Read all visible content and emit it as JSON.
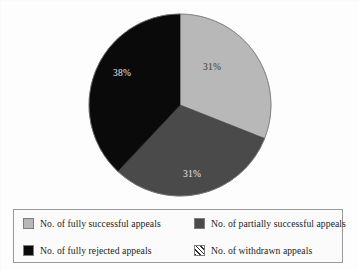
{
  "chart_data": {
    "type": "pie",
    "title": "",
    "subtitle": "",
    "xlabel": "",
    "ylabel": "",
    "grid": false,
    "legend_position": "bottom",
    "units": "percent",
    "start_angle_deg": 0,
    "direction": "clockwise",
    "categories": [
      "No. of fully successful appeals",
      "No. of partially successful appeals",
      "No. of fully rejected appeals",
      "No. of withdrawn appeals"
    ],
    "values": [
      31,
      31,
      38,
      0
    ],
    "data_labels": [
      "31%",
      "31%",
      "38%",
      ""
    ],
    "colors": [
      "#b8b8b8",
      "#4a4a4a",
      "#0a0a0a",
      "#ffffff"
    ],
    "slices": [
      {
        "label": "No. of fully successful appeals",
        "value": 31,
        "display": "31%",
        "color": "#b8b8b8",
        "pattern": "solid",
        "label_x": 212,
        "label_y": 70,
        "label_tone": "dark-text"
      },
      {
        "label": "No. of partially successful appeals",
        "value": 31,
        "display": "31%",
        "color": "#4a4a4a",
        "pattern": "solid",
        "label_x": 192,
        "label_y": 177,
        "label_tone": "light-text"
      },
      {
        "label": "No. of fully rejected appeals",
        "value": 38,
        "display": "38%",
        "color": "#0a0a0a",
        "pattern": "solid",
        "label_x": 122,
        "label_y": 76,
        "label_tone": "light-text"
      },
      {
        "label": "No. of withdrawn appeals",
        "value": 0,
        "display": "",
        "color": "#ffffff",
        "pattern": "diagonal-hatch",
        "label_x": 0,
        "label_y": 0,
        "label_tone": "dark-text"
      }
    ],
    "geometry": {
      "center_x": 180,
      "center_y": 105,
      "radius": 91
    }
  },
  "legend": {
    "entries": [
      {
        "label": "No. of fully successful appeals",
        "color": "#b8b8b8",
        "pattern": "solid"
      },
      {
        "label": "No. of partially successful appeals",
        "color": "#4a4a4a",
        "pattern": "solid"
      },
      {
        "label": "No. of fully rejected appeals",
        "color": "#0a0a0a",
        "pattern": "solid"
      },
      {
        "label": "No. of withdrawn appeals",
        "color": "#ffffff",
        "pattern": "diagonal-hatch"
      }
    ]
  }
}
